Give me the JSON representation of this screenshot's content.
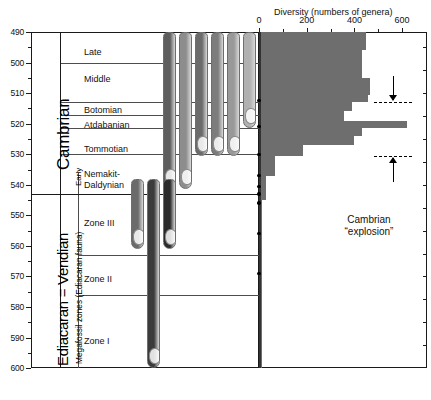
{
  "figure": {
    "time_axis": {
      "label_unit": "Ma",
      "top": 490,
      "bottom": 600,
      "major_ticks": [
        490,
        500,
        510,
        520,
        530,
        540,
        550,
        560,
        570,
        580,
        590,
        600
      ],
      "minor_step": 5
    }
  },
  "systems": [
    {
      "name": "Cambrian",
      "top": 490,
      "bottom": 543
    },
    {
      "name": "Ediacaran = Vendian",
      "top": 543,
      "bottom": 600
    }
  ],
  "series_label": "Megafossil zones (Ediacaran fauna)",
  "epochs": [
    {
      "name": "Early",
      "top": 513,
      "bottom": 543
    }
  ],
  "stages": [
    {
      "name": "Late",
      "top": 490,
      "bottom": 500
    },
    {
      "name": "Middle",
      "top": 500,
      "bottom": 513
    },
    {
      "name": "Botomian",
      "top": 513,
      "bottom": 517
    },
    {
      "name": "Atdabanian",
      "top": 517,
      "bottom": 521.5
    },
    {
      "name": "Tommotian",
      "top": 521.5,
      "bottom": 530
    },
    {
      "name": "Nemakit-Daldynian",
      "top": 530,
      "bottom": 543
    }
  ],
  "zones": [
    {
      "name": "Zone III",
      "top": 543,
      "bottom": 563
    },
    {
      "name": "Zone II",
      "top": 563,
      "bottom": 576
    },
    {
      "name": "Zone I",
      "top": 576,
      "bottom": 600
    }
  ],
  "taxa": [
    {
      "name": "Anabarites",
      "top": 490,
      "bottom": 541.5,
      "shade": "#5e5e5e"
    },
    {
      "name": "Arthropod traces",
      "top": 490,
      "bottom": 541.5,
      "shade": "#8d8d8d"
    },
    {
      "name": "Archaeocyathans",
      "top": 490,
      "bottom": 530.5,
      "shade": "#6b6b6b"
    },
    {
      "name": "Barchiopods",
      "top": 490,
      "bottom": 530.5,
      "shade": "#7c7c7c"
    },
    {
      "name": "Deep vertical burrows",
      "top": 490,
      "bottom": 530.5,
      "shade": "#999999"
    },
    {
      "name": "Trilobites",
      "top": 490,
      "bottom": 521.5,
      "shade": "#b0b0b0"
    },
    {
      "name": "Cloudina",
      "top": 538,
      "bottom": 561,
      "shade": "#6b6b6b"
    },
    {
      "name": "Ediacaran fauna",
      "top": 538,
      "bottom": 600,
      "shade": "#3b3b3b"
    },
    {
      "name": "Sinotubulites",
      "top": 538,
      "bottom": 561,
      "shade": "#2b2b2b"
    }
  ],
  "chart_data": {
    "type": "area",
    "title": "Diversity (numbers of genera)",
    "xlabel": "Diversity (numbers of genera)",
    "ylabel": "Age (Ma)",
    "xlim": [
      0,
      700
    ],
    "ylim": [
      600,
      490
    ],
    "xticks": [
      0,
      200,
      400,
      600
    ],
    "xticklabels": [
      "0",
      "200",
      "400",
      "600"
    ],
    "grid": false,
    "orientation": "horizontal-steps",
    "steps": [
      {
        "top": 490,
        "bottom": 496,
        "value": 450
      },
      {
        "top": 496,
        "bottom": 505,
        "value": 430
      },
      {
        "top": 505,
        "bottom": 510.5,
        "value": 465
      },
      {
        "top": 510.5,
        "bottom": 513,
        "value": 455
      },
      {
        "top": 513,
        "bottom": 516,
        "value": 390
      },
      {
        "top": 516,
        "bottom": 519,
        "value": 355
      },
      {
        "top": 519,
        "bottom": 521.5,
        "value": 620
      },
      {
        "top": 521.5,
        "bottom": 524,
        "value": 430
      },
      {
        "top": 524,
        "bottom": 527,
        "value": 400
      },
      {
        "top": 527,
        "bottom": 530.5,
        "value": 185
      },
      {
        "top": 530.5,
        "bottom": 537,
        "value": 65
      },
      {
        "top": 537,
        "bottom": 545,
        "value": 30
      },
      {
        "top": 545,
        "bottom": 600,
        "value": 12
      }
    ],
    "markers": [
      {
        "age": 512.5,
        "value": 0
      },
      {
        "age": 521,
        "value": 0
      },
      {
        "age": 530,
        "value": 0
      },
      {
        "age": 537,
        "value": 0
      },
      {
        "age": 540.5,
        "value": 0
      },
      {
        "age": 543,
        "value": 0
      },
      {
        "age": 546,
        "value": 0
      },
      {
        "age": 556,
        "value": 0
      },
      {
        "age": 569,
        "value": 0
      }
    ],
    "annotations": [
      {
        "text": "Cambrian\n\"explosion\"",
        "kind": "bracket-label"
      }
    ],
    "guides": [
      {
        "age": 513,
        "x_from": 480,
        "x_to": 640,
        "style": "dashed",
        "arrow": "down"
      },
      {
        "age": 530.5,
        "x_from": 480,
        "x_to": 640,
        "style": "dashed",
        "arrow": "up"
      }
    ]
  },
  "annotation": {
    "line1": "Cambrian",
    "line2": "“explosion”"
  }
}
